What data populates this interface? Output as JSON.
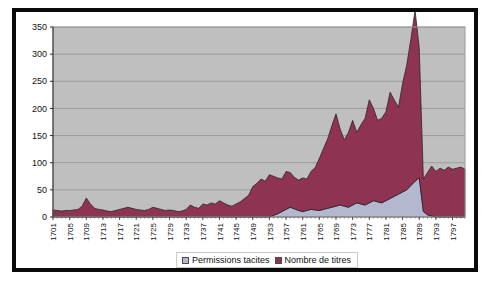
{
  "figure": {
    "background_color": "#ffffff",
    "frame_color": "#0a0a0a",
    "caption_partial": ""
  },
  "legend": {
    "position": "bottom-center",
    "entries": [
      {
        "label": "Permissions tacites",
        "color": "#b3b7cf",
        "swatch_name": "legend-swatch-permissions-tacites"
      },
      {
        "label": "Nombre de titres",
        "color": "#8e3352",
        "swatch_name": "legend-swatch-nombre-de-titres"
      }
    ]
  },
  "chart_data": {
    "type": "area",
    "stacked": true,
    "title": "",
    "subtitle": "",
    "xlabel": "",
    "ylabel": "",
    "grid": true,
    "legend_position": "bottom",
    "plot_background": "#bfbfbf",
    "gridline_color": "#8c8c8c",
    "xlim": [
      1701,
      1800
    ],
    "ylim": [
      0,
      350
    ],
    "yticks": [
      0,
      50,
      100,
      150,
      200,
      250,
      300,
      350
    ],
    "ytick_labels": [
      "0",
      "50",
      "100",
      "150",
      "200",
      "250",
      "300",
      "350"
    ],
    "xticks": [
      1701,
      1705,
      1709,
      1713,
      1717,
      1721,
      1725,
      1729,
      1733,
      1737,
      1741,
      1745,
      1749,
      1753,
      1757,
      1761,
      1765,
      1769,
      1773,
      1777,
      1781,
      1785,
      1789,
      1793,
      1797
    ],
    "xtick_labels": [
      "1701",
      "1705",
      "1709",
      "1713",
      "1717",
      "1721",
      "1725",
      "1729",
      "1733",
      "1737",
      "1741",
      "1745",
      "1749",
      "1753",
      "1757",
      "1761",
      "1765",
      "1769",
      "1773",
      "1777",
      "1781",
      "1785",
      "1789",
      "1793",
      "1797"
    ],
    "x": [
      1701,
      1702,
      1703,
      1704,
      1705,
      1706,
      1707,
      1708,
      1709,
      1710,
      1711,
      1712,
      1713,
      1714,
      1715,
      1716,
      1717,
      1718,
      1719,
      1720,
      1721,
      1722,
      1723,
      1724,
      1725,
      1726,
      1727,
      1728,
      1729,
      1730,
      1731,
      1732,
      1733,
      1734,
      1735,
      1736,
      1737,
      1738,
      1739,
      1740,
      1741,
      1742,
      1743,
      1744,
      1745,
      1746,
      1747,
      1748,
      1749,
      1750,
      1751,
      1752,
      1753,
      1754,
      1755,
      1756,
      1757,
      1758,
      1759,
      1760,
      1761,
      1762,
      1763,
      1764,
      1765,
      1766,
      1767,
      1768,
      1769,
      1770,
      1771,
      1772,
      1773,
      1774,
      1775,
      1776,
      1777,
      1778,
      1779,
      1780,
      1781,
      1782,
      1783,
      1784,
      1785,
      1786,
      1787,
      1788,
      1789,
      1790,
      1791,
      1792,
      1793,
      1794,
      1795,
      1796,
      1797,
      1798,
      1799,
      1800
    ],
    "series": [
      {
        "name": "Permissions tacites",
        "color": "#b3b7cf",
        "stack_order": 1,
        "values": [
          0,
          0,
          0,
          0,
          0,
          0,
          0,
          0,
          0,
          0,
          0,
          0,
          0,
          0,
          0,
          0,
          0,
          0,
          0,
          0,
          0,
          0,
          0,
          0,
          0,
          0,
          0,
          0,
          0,
          0,
          0,
          0,
          0,
          0,
          0,
          0,
          0,
          0,
          0,
          0,
          0,
          0,
          0,
          0,
          0,
          0,
          0,
          0,
          0,
          0,
          0,
          0,
          0,
          3,
          6,
          10,
          14,
          18,
          15,
          12,
          10,
          12,
          14,
          13,
          12,
          14,
          16,
          18,
          20,
          22,
          20,
          18,
          22,
          26,
          24,
          22,
          26,
          30,
          28,
          26,
          30,
          34,
          38,
          42,
          46,
          50,
          58,
          66,
          72,
          10,
          4,
          2,
          0,
          0,
          0,
          0,
          0,
          0,
          0,
          0
        ]
      },
      {
        "name": "Nombre de titres",
        "color": "#8e3352",
        "stack_order": 2,
        "values": [
          13,
          12,
          11,
          12,
          12,
          13,
          14,
          20,
          35,
          24,
          16,
          14,
          13,
          11,
          10,
          12,
          14,
          16,
          18,
          16,
          14,
          13,
          12,
          14,
          18,
          16,
          14,
          12,
          13,
          12,
          10,
          11,
          14,
          22,
          18,
          16,
          24,
          22,
          26,
          24,
          30,
          26,
          22,
          20,
          24,
          28,
          34,
          40,
          56,
          62,
          70,
          66,
          78,
          72,
          66,
          60,
          70,
          64,
          58,
          56,
          62,
          58,
          70,
          78,
          96,
          112,
          128,
          150,
          170,
          140,
          122,
          138,
          156,
          130,
          146,
          160,
          190,
          170,
          150,
          156,
          164,
          196,
          178,
          160,
          200,
          230,
          270,
          315,
          240,
          60,
          78,
          92,
          84,
          90,
          86,
          92,
          88,
          90,
          92,
          88
        ]
      }
    ],
    "annotations": [
      {
        "text": "peak",
        "x": 1788,
        "y": 315
      }
    ]
  }
}
